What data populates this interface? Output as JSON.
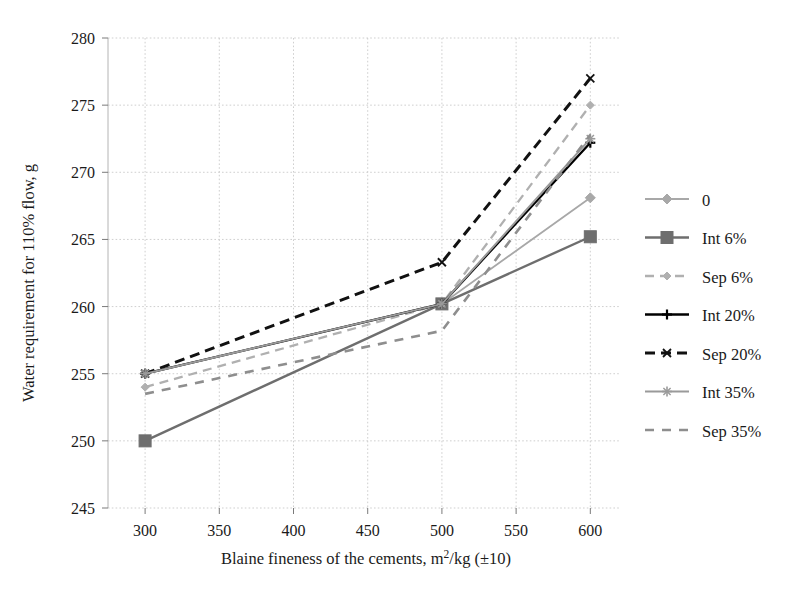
{
  "chart_data": {
    "type": "line",
    "title": "",
    "xlabel": "Blaine fineness of the cements, m2/kg (±10)",
    "xlabel_parts": {
      "pre": "Blaine fineness of the cements, m",
      "sup": "2",
      "post": "/kg (±10)"
    },
    "ylabel": "Water requirement for 110% flow, g",
    "xlim": [
      275,
      620
    ],
    "ylim": [
      245,
      280
    ],
    "xticks": [
      300,
      350,
      400,
      450,
      500,
      550,
      600
    ],
    "yticks": [
      245,
      250,
      255,
      260,
      265,
      270,
      275,
      280
    ],
    "grid": true,
    "legend_position": "right",
    "x": [
      300,
      500,
      600
    ],
    "series": [
      {
        "name": "0",
        "values": [
          255.0,
          260.2,
          268.1
        ],
        "color": "#a8a8a8",
        "dash": "none",
        "width": 1.8,
        "marker": "diamond",
        "marker_size": 5.0
      },
      {
        "name": "Int 6%",
        "values": [
          250.0,
          260.2,
          265.2
        ],
        "color": "#6e6e6e",
        "dash": "none",
        "width": 2.4,
        "marker": "square",
        "marker_size": 6.0
      },
      {
        "name": "Sep 6%",
        "values": [
          254.0,
          260.2,
          275.0
        ],
        "color": "#b0b0b0",
        "dash": "9 6",
        "width": 2.3,
        "marker": "diamond",
        "marker_size": 4.0
      },
      {
        "name": "Int 20%",
        "values": [
          255.0,
          260.2,
          272.2
        ],
        "color": "#000000",
        "dash": "none",
        "width": 2.3,
        "marker": "plus",
        "marker_size": 5.0
      },
      {
        "name": "Sep 20%",
        "values": [
          255.0,
          263.3,
          277.0
        ],
        "color": "#111111",
        "dash": "10 6",
        "width": 3.0,
        "marker": "cross",
        "marker_size": 4.0
      },
      {
        "name": "Int 35%",
        "values": [
          255.0,
          260.2,
          272.5
        ],
        "color": "#9a9a9a",
        "dash": "none",
        "width": 2.0,
        "marker": "star",
        "marker_size": 5.0
      },
      {
        "name": "Sep 35%",
        "values": [
          253.5,
          258.2,
          272.8
        ],
        "color": "#8e8e8e",
        "dash": "9 8",
        "width": 2.6,
        "marker": "none",
        "marker_size": 0
      }
    ]
  },
  "legend": {
    "entries": [
      {
        "label": "0"
      },
      {
        "label": "Int 6%"
      },
      {
        "label": "Sep 6%"
      },
      {
        "label": "Int 20%"
      },
      {
        "label": "Sep 20%"
      },
      {
        "label": "Int 35%"
      },
      {
        "label": "Sep 35%"
      }
    ]
  },
  "axes": {
    "x_tick_labels": [
      "300",
      "350",
      "400",
      "450",
      "500",
      "550",
      "600"
    ],
    "y_tick_labels": [
      "245",
      "250",
      "255",
      "260",
      "265",
      "270",
      "275",
      "280"
    ]
  },
  "colors": {
    "grid": "#c9c9c9",
    "axis": "#b4b4b4",
    "text": "#1a1a1a",
    "background": "#ffffff"
  }
}
